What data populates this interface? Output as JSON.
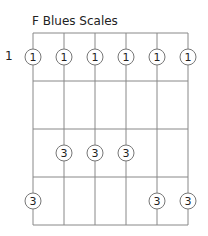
{
  "title": "F Blues Scales",
  "start_fret_label": "1",
  "grid": {
    "strings": 6,
    "frets": 4,
    "left": 33,
    "top": 33,
    "string_spacing": 31,
    "fret_spacing": 48,
    "line_color": "#888888"
  },
  "dots": [
    {
      "string": 0,
      "fret": 0,
      "label": "1"
    },
    {
      "string": 1,
      "fret": 0,
      "label": "1"
    },
    {
      "string": 2,
      "fret": 0,
      "label": "1"
    },
    {
      "string": 3,
      "fret": 0,
      "label": "1"
    },
    {
      "string": 4,
      "fret": 0,
      "label": "1"
    },
    {
      "string": 5,
      "fret": 0,
      "label": "1"
    },
    {
      "string": 1,
      "fret": 2,
      "label": "3"
    },
    {
      "string": 2,
      "fret": 2,
      "label": "3"
    },
    {
      "string": 3,
      "fret": 2,
      "label": "3"
    },
    {
      "string": 0,
      "fret": 3,
      "label": "3"
    },
    {
      "string": 4,
      "fret": 3,
      "label": "3"
    },
    {
      "string": 5,
      "fret": 3,
      "label": "3"
    }
  ]
}
